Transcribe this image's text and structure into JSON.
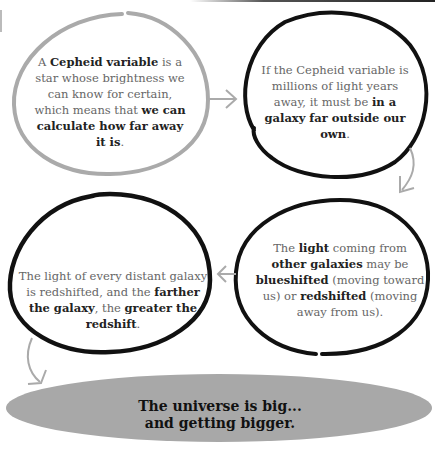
{
  "diagram": {
    "nodes": [
      {
        "id": "cepheid",
        "style": "gray-outline",
        "segments": [
          {
            "text": "A ",
            "bold": false
          },
          {
            "text": "Cepheid variable",
            "bold": true
          },
          {
            "text": " is a star whose brightness we can know for certain, which means that ",
            "bold": false
          },
          {
            "text": "we can calculate how far away it is",
            "bold": true
          },
          {
            "text": ".",
            "bold": false
          }
        ]
      },
      {
        "id": "galaxy",
        "style": "black-outline",
        "segments": [
          {
            "text": "If the Cepheid variable is millions of light years away, it must be ",
            "bold": false
          },
          {
            "text": "in a galaxy far outside our own",
            "bold": true
          },
          {
            "text": ".",
            "bold": false
          }
        ]
      },
      {
        "id": "shift",
        "style": "black-outline",
        "segments": [
          {
            "text": "The ",
            "bold": false
          },
          {
            "text": "light",
            "bold": true
          },
          {
            "text": " coming from ",
            "bold": false
          },
          {
            "text": "other galaxies",
            "bold": true
          },
          {
            "text": " may be ",
            "bold": false
          },
          {
            "text": "blueshifted",
            "bold": true
          },
          {
            "text": " (moving toward us) or ",
            "bold": false
          },
          {
            "text": "redshifted",
            "bold": true
          },
          {
            "text": " (moving away from us).",
            "bold": false
          }
        ]
      },
      {
        "id": "redshift",
        "style": "black-outline",
        "segments": [
          {
            "text": "The light of every distant galaxy is redshifted, and the ",
            "bold": false
          },
          {
            "text": "farther the galaxy",
            "bold": true
          },
          {
            "text": ", the ",
            "bold": false
          },
          {
            "text": "greater the redshift",
            "bold": true
          },
          {
            "text": ".",
            "bold": false
          }
        ]
      }
    ],
    "edges": [
      {
        "from": "cepheid",
        "to": "galaxy",
        "direction": "right"
      },
      {
        "from": "galaxy",
        "to": "shift",
        "direction": "down"
      },
      {
        "from": "shift",
        "to": "redshift",
        "direction": "left"
      },
      {
        "from": "redshift",
        "to": "conclusion",
        "direction": "down"
      }
    ],
    "conclusion": {
      "line1": "The universe is big...",
      "line2": "and getting bigger."
    },
    "colors": {
      "gray_outline": "#aaaaaa",
      "black_outline": "#111111",
      "arrow": "#aaaaaa",
      "banner_fill": "#a8a8a8",
      "bold_text": "#222222",
      "body_text": "#666666"
    }
  }
}
